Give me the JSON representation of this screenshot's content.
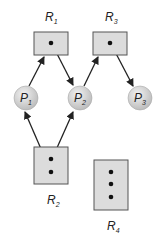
{
  "diagram": {
    "type": "resource-allocation-graph",
    "colors": {
      "resource_fill": "#dcdcdc",
      "resource_stroke": "#555555",
      "process_fill": "#d4d4d4",
      "edge": "#222222",
      "dot": "#111111"
    },
    "resources": [
      {
        "id": "R1",
        "name": "R",
        "sub": "1",
        "instances": 1
      },
      {
        "id": "R2",
        "name": "R",
        "sub": "2",
        "instances": 2
      },
      {
        "id": "R3",
        "name": "R",
        "sub": "3",
        "instances": 1
      },
      {
        "id": "R4",
        "name": "R",
        "sub": "4",
        "instances": 3
      }
    ],
    "processes": [
      {
        "id": "P1",
        "name": "P",
        "sub": "1"
      },
      {
        "id": "P2",
        "name": "P",
        "sub": "2"
      },
      {
        "id": "P3",
        "name": "P",
        "sub": "3"
      }
    ],
    "edges": [
      {
        "from": "P1",
        "to": "R1",
        "kind": "request"
      },
      {
        "from": "R1",
        "to": "P2",
        "kind": "assignment"
      },
      {
        "from": "P2",
        "to": "R3",
        "kind": "request"
      },
      {
        "from": "R3",
        "to": "P3",
        "kind": "assignment"
      },
      {
        "from": "R2",
        "to": "P1",
        "kind": "assignment"
      },
      {
        "from": "R2",
        "to": "P2",
        "kind": "assignment"
      }
    ]
  }
}
